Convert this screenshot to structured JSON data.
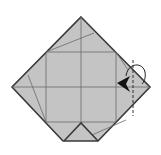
{
  "diagram": {
    "type": "origami-fold-step",
    "colors": {
      "paper": "#c4c4c4",
      "outline": "#3a3a3a",
      "crease": "#6a6a6a",
      "arrow": "#111111",
      "background": "#ffffff"
    },
    "elements": [
      {
        "name": "paper-outline",
        "shape": "diamond with truncated bottom"
      },
      {
        "name": "inner-square-creases"
      },
      {
        "name": "center-crease-lines"
      },
      {
        "name": "bottom-triangle-flap"
      },
      {
        "name": "fold-line-dashed",
        "style": "valley fold (dashed)"
      },
      {
        "name": "fold-arrow",
        "direction": "fold right corner behind/over to the left"
      }
    ]
  }
}
